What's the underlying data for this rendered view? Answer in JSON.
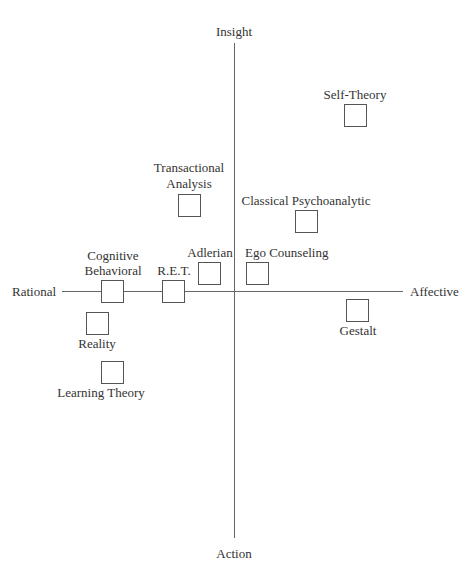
{
  "axes": {
    "top": "Insight",
    "bottom": "Action",
    "left": "Rational",
    "right": "Affective"
  },
  "items": [
    {
      "id": "self-theory",
      "label": "Self-Theory"
    },
    {
      "id": "transactional-analysis",
      "label_line1": "Transactional",
      "label_line2": "Analysis"
    },
    {
      "id": "classical-psychoanalytic",
      "label": "Classical Psychoanalytic"
    },
    {
      "id": "cognitive-behavioral",
      "label_line1": "Cognitive",
      "label_line2": "Behavioral"
    },
    {
      "id": "ret",
      "label": "R.E.T."
    },
    {
      "id": "adlerian",
      "label": "Adlerian"
    },
    {
      "id": "ego-counseling",
      "label": "Ego Counseling"
    },
    {
      "id": "gestalt",
      "label": "Gestalt"
    },
    {
      "id": "reality",
      "label": "Reality"
    },
    {
      "id": "learning-theory",
      "label": "Learning Theory"
    }
  ]
}
